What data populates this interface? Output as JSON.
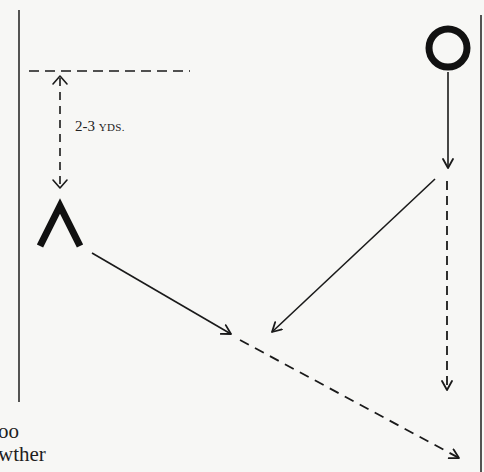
{
  "diagram": {
    "type": "football-play-diagram",
    "distance_label": {
      "number": "2-3",
      "unit": "YDS."
    },
    "players": [
      {
        "symbol": "chevron",
        "name": "defender-chevron",
        "label": "Λ"
      },
      {
        "symbol": "circle",
        "name": "offensive-player-circle",
        "label": "O"
      }
    ],
    "routes": [
      {
        "from": "circle",
        "style": "solid",
        "direction": "down"
      },
      {
        "from": "circle",
        "style": "solid",
        "direction": "down-left diagonal"
      },
      {
        "from": "circle",
        "style": "dashed",
        "direction": "down"
      },
      {
        "from": "chevron",
        "style": "solid",
        "direction": "down-right diagonal"
      },
      {
        "from": "intersection",
        "style": "dashed",
        "direction": "down-right diagonal"
      }
    ],
    "colors": {
      "ink": "#1a1a1a",
      "paper": "#f7f7f5"
    }
  },
  "cutoff_text": {
    "line1": "oo",
    "line2": "wther"
  }
}
